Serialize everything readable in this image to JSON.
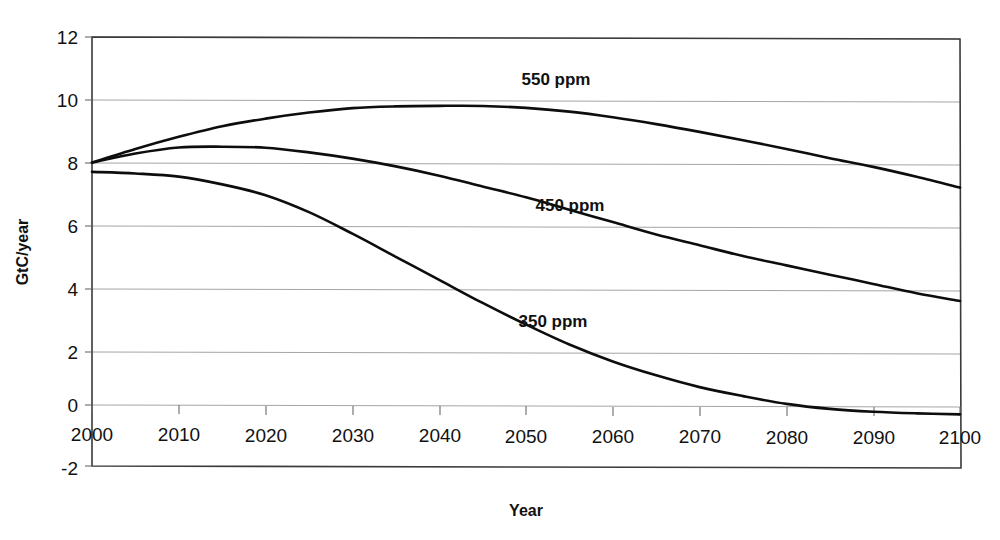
{
  "chart_data": {
    "type": "line",
    "title": "",
    "xlabel": "Year",
    "ylabel": "GtC/year",
    "xlim": [
      2000,
      2100
    ],
    "ylim": [
      -2,
      12
    ],
    "grid": true,
    "legend_position": "inline-annotations",
    "xticks": [
      "2000",
      "2010",
      "2020",
      "2030",
      "2040",
      "2050",
      "2060",
      "2070",
      "2080",
      "2090",
      "2100"
    ],
    "yticks": [
      "12",
      "10",
      "8",
      "6",
      "4",
      "2",
      "0",
      "-2"
    ],
    "x": [
      2000,
      2005,
      2010,
      2015,
      2020,
      2025,
      2030,
      2035,
      2040,
      2045,
      2050,
      2055,
      2060,
      2065,
      2070,
      2075,
      2080,
      2085,
      2090,
      2095,
      2100
    ],
    "series": [
      {
        "name": "550 ppm",
        "label": "550 ppm",
        "color": "#0d0d0d",
        "values": [
          7.9,
          8.35,
          8.75,
          9.1,
          9.35,
          9.55,
          9.7,
          9.76,
          9.78,
          9.78,
          9.72,
          9.6,
          9.42,
          9.2,
          8.95,
          8.68,
          8.4,
          8.1,
          7.82,
          7.5,
          7.15
        ]
      },
      {
        "name": "450 ppm",
        "label": "450 ppm",
        "color": "#0d0d0d",
        "values": [
          7.9,
          8.2,
          8.4,
          8.43,
          8.4,
          8.25,
          8.05,
          7.8,
          7.5,
          7.15,
          6.8,
          6.4,
          6.0,
          5.6,
          5.25,
          4.9,
          4.6,
          4.3,
          4.0,
          3.7,
          3.45
        ]
      },
      {
        "name": "350 ppm",
        "label": "350 ppm",
        "color": "#0d0d0d",
        "values": [
          7.6,
          7.55,
          7.45,
          7.2,
          6.85,
          6.3,
          5.6,
          4.85,
          4.1,
          3.35,
          2.65,
          2.0,
          1.45,
          1.0,
          0.62,
          0.33,
          0.08,
          -0.08,
          -0.17,
          -0.22,
          -0.25
        ]
      }
    ],
    "annotations": [
      {
        "text": "550 ppm",
        "x": 2048,
        "y": 10.85
      },
      {
        "text": "450 ppm",
        "x": 2053,
        "y": 6.85
      },
      {
        "text": "350 ppm",
        "x": 2050,
        "y": 3.1
      }
    ]
  }
}
